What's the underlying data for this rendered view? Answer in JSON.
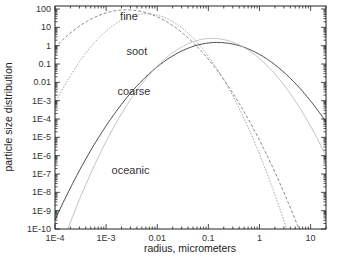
{
  "chart_data": {
    "type": "line",
    "title": "",
    "xlabel": "radius, micrometers",
    "ylabel": "particle size distribution",
    "xscale": "log",
    "yscale": "log",
    "xlim": [
      0.0001,
      20
    ],
    "ylim": [
      1e-10,
      100
    ],
    "grid": false,
    "legend": "none (inline curve labels)",
    "x_ticks": [
      "1E-4",
      "1E-3",
      "0.01",
      "0.1",
      "1",
      "10"
    ],
    "y_ticks": [
      "100",
      "10",
      "1",
      "0.1",
      "0.01",
      "1E-3",
      "1E-4",
      "1E-5",
      "1E-6",
      "1E-7",
      "1E-8",
      "1E-9",
      "1E-10"
    ],
    "series": [
      {
        "name": "fine",
        "style": "dashed",
        "color": "#777777",
        "peak_radius": 0.0025,
        "peak_value": 90,
        "log_curvature": 1.05,
        "points": [
          [
            0.0001,
            8
          ],
          [
            0.001,
            60
          ],
          [
            0.0025,
            90
          ],
          [
            0.01,
            50
          ],
          [
            0.1,
            1.0
          ],
          [
            1,
            1e-05
          ],
          [
            5,
            1e-10
          ]
        ]
      },
      {
        "name": "soot",
        "style": "dotted",
        "color": "#999999",
        "peak_radius": 0.006,
        "peak_value": 55,
        "log_curvature": 1.55,
        "points": [
          [
            0.0001,
            1e-06
          ],
          [
            0.001,
            5
          ],
          [
            0.006,
            55
          ],
          [
            0.03,
            10
          ],
          [
            0.1,
            0.5
          ],
          [
            1,
            1e-06
          ],
          [
            1.1,
            1e-10
          ]
        ]
      },
      {
        "name": "coarse",
        "style": "solid",
        "color": "#333333",
        "peak_radius": 0.15,
        "peak_value": 1.5,
        "log_curvature": 0.96,
        "points": [
          [
            0.0001,
            3e-09
          ],
          [
            0.001,
            1e-05
          ],
          [
            0.01,
            0.02
          ],
          [
            0.15,
            1.5
          ],
          [
            1,
            0.3
          ],
          [
            10,
            0.0001
          ],
          [
            20,
            1e-06
          ]
        ]
      },
      {
        "name": "oceanic",
        "style": "solid",
        "color": "#bbbbbb",
        "peak_radius": 0.12,
        "peak_value": 2.5,
        "log_curvature": 1.3,
        "points": [
          [
            0.0002,
            1e-10
          ],
          [
            0.001,
            1e-07
          ],
          [
            0.01,
            0.005
          ],
          [
            0.12,
            2.5
          ],
          [
            1,
            0.1
          ],
          [
            10,
            0.0001
          ],
          [
            20,
            1e-05
          ]
        ]
      }
    ],
    "annotations": [
      {
        "text": "fine",
        "x": 0.0028,
        "y": 25
      },
      {
        "text": "soot",
        "x": 0.004,
        "y": 0.3
      },
      {
        "text": "coarse",
        "x": 0.0035,
        "y": 0.002
      },
      {
        "text": "oceanic",
        "x": 0.003,
        "y": 1e-07
      }
    ]
  },
  "plot_area": {
    "left": 55,
    "top": 6,
    "right": 326,
    "bottom": 229
  }
}
